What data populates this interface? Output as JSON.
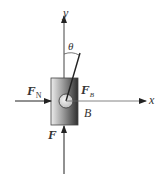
{
  "diagram": {
    "axes": {
      "x_label": "x",
      "y_label": "y"
    },
    "angle_label": "θ",
    "block_label": "B",
    "forces": [
      {
        "id": "FN",
        "symbol": "F",
        "subscript": "N",
        "direction": "horizontal, pointing right into block"
      },
      {
        "id": "FB",
        "symbol": "F",
        "subscript": "B",
        "direction": "inclined at angle θ from vertical y-axis"
      },
      {
        "id": "F",
        "symbol": "F",
        "subscript": "",
        "direction": "vertical, pointing up into block"
      }
    ],
    "colors": {
      "line": "#222222",
      "block_light": "#e8e8e8",
      "block_dark": "#333333",
      "circle_fill": "#d8d8d8"
    }
  }
}
